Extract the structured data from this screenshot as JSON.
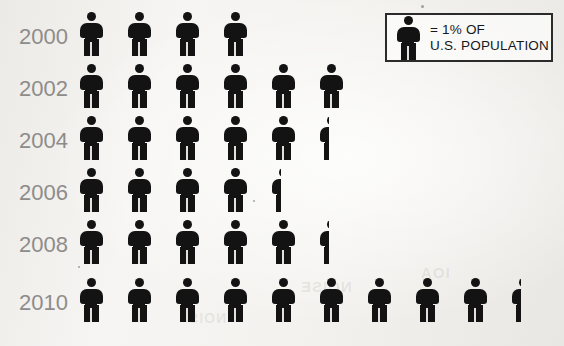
{
  "chart_data": {
    "type": "pictogram",
    "title": "",
    "subtitle": "",
    "xlabel": "",
    "ylabel": "",
    "unit_label": "= 1% OF U.S. POPULATION",
    "unit_value": 1,
    "unit_suffix": "%",
    "icon": "person-icon",
    "icon_color": "#131313",
    "label_color": "#8e8c8a",
    "categories": [
      "2000",
      "2002",
      "2004",
      "2006",
      "2008",
      "2010"
    ],
    "values": [
      4,
      6,
      5.5,
      4.5,
      5.5,
      9.5
    ],
    "series": [
      {
        "name": "Percent of U.S. population",
        "values": [
          4,
          6,
          5.5,
          4.5,
          5.5,
          9.5
        ]
      }
    ],
    "rows": [
      {
        "label": "2000",
        "value": 4,
        "full_icons": 4,
        "half_icon": false
      },
      {
        "label": "2002",
        "value": 6,
        "full_icons": 6,
        "half_icon": false
      },
      {
        "label": "2004",
        "value": 5.5,
        "full_icons": 5,
        "half_icon": true
      },
      {
        "label": "2006",
        "value": 4.5,
        "full_icons": 4,
        "half_icon": true
      },
      {
        "label": "2008",
        "value": 5.5,
        "full_icons": 5,
        "half_icon": true
      },
      {
        "label": "2010",
        "value": 9.5,
        "full_icons": 9,
        "half_icon": true
      }
    ],
    "grid": false,
    "legend_position": "top-right"
  },
  "legend": {
    "equals_line": "= 1% OF",
    "population_line": "U.S. POPULATION"
  },
  "years": {
    "y2000": "2000",
    "y2002": "2002",
    "y2004": "2004",
    "y2006": "2006",
    "y2008": "2008",
    "y2010": "2010"
  },
  "background_bleed": [
    {
      "text": "NOISE",
      "x": 300,
      "y": 286,
      "size": 15
    },
    {
      "text": "IOA",
      "x": 420,
      "y": 272,
      "size": 15
    },
    {
      "text": "NOIS",
      "x": 188,
      "y": 318,
      "size": 14
    }
  ]
}
